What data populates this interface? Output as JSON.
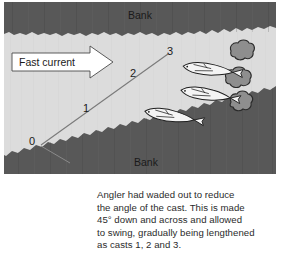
{
  "figure": {
    "type": "fishing-river-diagram",
    "bank_label_top": "Bank",
    "bank_label_bottom": "Bank",
    "current_label": "Fast current",
    "cast_labels": [
      "0",
      "1",
      "2",
      "3"
    ],
    "caption": "Angler had waded out to reduce\nthe angle of the cast. This is made\n45° down and across and allowed\nto swing, gradually being lengthened\nas casts 1, 2 and 3."
  },
  "colors": {
    "bank_fill": "#585858",
    "water_fill": "#dcdcdc",
    "rock_fill": "#8e8e8e",
    "fish_fill": "#f2f2f2",
    "outline": "#1a1a1a",
    "arrow_fill": "#ffffff",
    "caption_text": "#2b2b2b"
  },
  "elements": {
    "fish_count": 3,
    "rock_count": 3,
    "current_arrow": "right-arrow-icon",
    "cast_line": "diagonal-cast-line",
    "angler_line": "angler-rod-line"
  }
}
